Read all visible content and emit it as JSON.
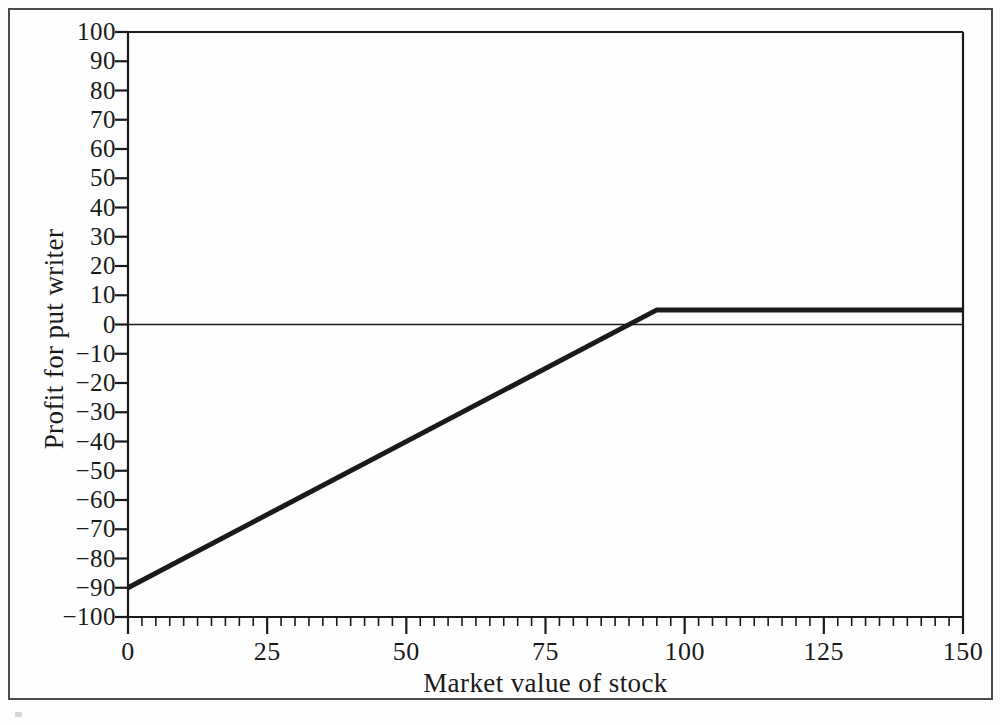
{
  "figure": {
    "background_color": "#fefefe",
    "frame_color": "#4a4a4a",
    "line_color": "#1a1a1a"
  },
  "chart_data": {
    "type": "line",
    "title": "",
    "xlabel": "Market value of stock",
    "ylabel": "Profit for put writer",
    "xlim": [
      0,
      150
    ],
    "ylim": [
      -100,
      100
    ],
    "grid": false,
    "legend": null,
    "x_major_ticks": [
      0,
      25,
      50,
      75,
      100,
      125,
      150
    ],
    "x_tick_labels": [
      "0",
      "25",
      "50",
      "75",
      "100",
      "125",
      "150"
    ],
    "x_minor_tick_step": 2.5,
    "y_major_ticks": [
      100,
      90,
      80,
      70,
      60,
      50,
      40,
      30,
      20,
      10,
      0,
      -10,
      -20,
      -30,
      -40,
      -50,
      -60,
      -70,
      -80,
      -90,
      -100
    ],
    "y_tick_labels": [
      "100",
      "90",
      "80",
      "70",
      "60",
      "50",
      "40",
      "30",
      "20",
      "10",
      "0",
      "−10",
      "−20",
      "−30",
      "−40",
      "−50",
      "−60",
      "−70",
      "−80",
      "−90",
      "−100"
    ],
    "zero_reference_line": {
      "y": 0,
      "x_from": 0,
      "x_to": 150,
      "style": "thin-solid"
    },
    "series": [
      {
        "name": "Profit for put writer",
        "style": "thick-solid",
        "x": [
          0,
          95,
          150
        ],
        "values": [
          -90,
          5,
          5
        ],
        "breakeven_x": 90,
        "strike_x": 95,
        "max_profit": 5,
        "min_profit_at_zero_stock": -90
      }
    ]
  }
}
